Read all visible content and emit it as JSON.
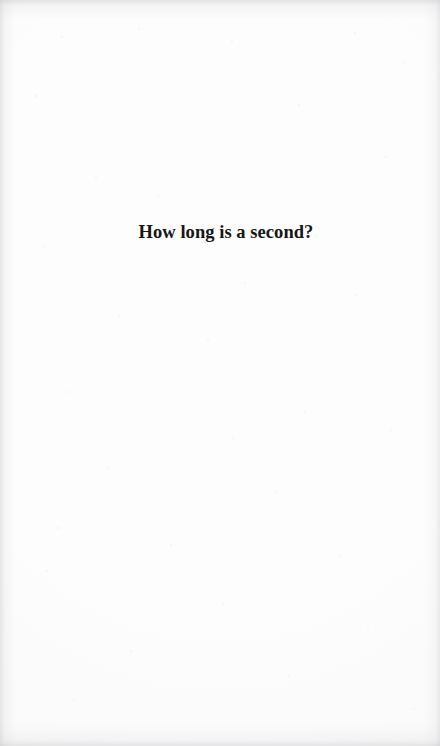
{
  "page": {
    "kind": "scanned-book-page",
    "width": 440,
    "height": 746,
    "paper_color": "#fdfdfd",
    "edge_shadow_color": "#c4c4c8",
    "ink_color": "#161616"
  },
  "content": {
    "heading": "How long is a second?"
  },
  "speckles": [
    {
      "x": 62,
      "y": 37,
      "r": 1.0,
      "o": 0.3
    },
    {
      "x": 139,
      "y": 29,
      "r": 0.9,
      "o": 0.26
    },
    {
      "x": 232,
      "y": 41,
      "r": 0.8,
      "o": 0.22
    },
    {
      "x": 355,
      "y": 33,
      "r": 1.0,
      "o": 0.28
    },
    {
      "x": 404,
      "y": 62,
      "r": 0.9,
      "o": 0.24
    },
    {
      "x": 36,
      "y": 96,
      "r": 1.1,
      "o": 0.3
    },
    {
      "x": 189,
      "y": 88,
      "r": 0.8,
      "o": 0.2
    },
    {
      "x": 299,
      "y": 105,
      "r": 0.9,
      "o": 0.26
    },
    {
      "x": 96,
      "y": 178,
      "r": 1.0,
      "o": 0.28
    },
    {
      "x": 158,
      "y": 196,
      "r": 0.8,
      "o": 0.22
    },
    {
      "x": 386,
      "y": 157,
      "r": 1.0,
      "o": 0.26
    },
    {
      "x": 44,
      "y": 246,
      "r": 0.9,
      "o": 0.24
    },
    {
      "x": 245,
      "y": 283,
      "r": 1.0,
      "o": 0.26
    },
    {
      "x": 356,
      "y": 295,
      "r": 0.9,
      "o": 0.22
    },
    {
      "x": 119,
      "y": 316,
      "r": 0.8,
      "o": 0.2
    },
    {
      "x": 208,
      "y": 340,
      "r": 1.0,
      "o": 0.25
    },
    {
      "x": 398,
      "y": 352,
      "r": 0.9,
      "o": 0.23
    },
    {
      "x": 67,
      "y": 392,
      "r": 1.0,
      "o": 0.27
    },
    {
      "x": 305,
      "y": 412,
      "r": 0.9,
      "o": 0.22
    },
    {
      "x": 233,
      "y": 438,
      "r": 0.8,
      "o": 0.19
    },
    {
      "x": 391,
      "y": 430,
      "r": 1.0,
      "o": 0.24
    },
    {
      "x": 108,
      "y": 468,
      "r": 0.9,
      "o": 0.23
    },
    {
      "x": 276,
      "y": 492,
      "r": 0.8,
      "o": 0.2
    },
    {
      "x": 58,
      "y": 528,
      "r": 1.1,
      "o": 0.3
    },
    {
      "x": 171,
      "y": 545,
      "r": 0.9,
      "o": 0.24
    },
    {
      "x": 339,
      "y": 556,
      "r": 0.8,
      "o": 0.21
    },
    {
      "x": 47,
      "y": 571,
      "r": 1.0,
      "o": 0.27
    },
    {
      "x": 223,
      "y": 604,
      "r": 0.9,
      "o": 0.22
    },
    {
      "x": 368,
      "y": 627,
      "r": 0.8,
      "o": 0.2
    },
    {
      "x": 131,
      "y": 651,
      "r": 1.0,
      "o": 0.25
    },
    {
      "x": 289,
      "y": 676,
      "r": 0.9,
      "o": 0.22
    },
    {
      "x": 74,
      "y": 700,
      "r": 0.8,
      "o": 0.2
    },
    {
      "x": 414,
      "y": 709,
      "r": 0.9,
      "o": 0.23
    }
  ]
}
